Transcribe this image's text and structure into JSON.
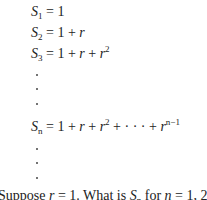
{
  "equations": [
    {
      "lhs_var": "S",
      "lhs_sub": "1",
      "rhs": "= 1"
    },
    {
      "lhs_var": "S",
      "lhs_sub": "2",
      "rhs": "= 1 + ",
      "rhs_var": "r"
    },
    {
      "lhs_var": "S",
      "lhs_sub": "3",
      "rhs_a": "= 1 + ",
      "rhs_var1": "r",
      "rhs_b": " + ",
      "rhs_var2": "r",
      "rhs_exp": "2"
    },
    {
      "lhs_var": "S",
      "lhs_sub": "n",
      "rhs_a": "= 1 + ",
      "rhs_var1": "r",
      "rhs_b": " + ",
      "rhs_var2": "r",
      "rhs_exp2": "2",
      "rhs_c": " + · · · + ",
      "rhs_var3": "r",
      "rhs_exp3": "n−1"
    }
  ],
  "question": {
    "part1": "Suppose ",
    "var_r": "r",
    "part2": " = 1.  What is ",
    "var_S": "S",
    "sub_n": "n",
    "part3": " for ",
    "var_n": "n",
    "part4": " = 1, 2, 3"
  }
}
